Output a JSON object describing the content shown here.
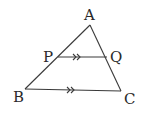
{
  "diagram": {
    "type": "geometry-triangle",
    "colors": {
      "line": "#3a3a3a",
      "text": "#2a2a2a",
      "background": "#ffffff"
    },
    "points": {
      "A": {
        "label": "A",
        "x": 90,
        "y": 25
      },
      "B": {
        "label": "B",
        "x": 25,
        "y": 89
      },
      "C": {
        "label": "C",
        "x": 121,
        "y": 91
      },
      "P": {
        "label": "P",
        "x": 58,
        "y": 57
      },
      "Q": {
        "label": "Q",
        "x": 107,
        "y": 57
      }
    },
    "segments": [
      "AB",
      "AC",
      "BC",
      "PQ"
    ],
    "parallel_marks": {
      "style": "double-arrow",
      "segments": [
        "PQ",
        "BC"
      ]
    }
  }
}
